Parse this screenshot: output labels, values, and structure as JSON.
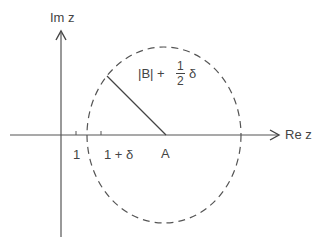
{
  "diagram": {
    "type": "complex-plane-disk",
    "colors": {
      "ink": "#444444",
      "background": "#ffffff"
    },
    "axes": {
      "x_label": "Re z",
      "y_label": "Im z"
    },
    "ticks": [
      {
        "label": "1"
      },
      {
        "label": "1 + δ"
      }
    ],
    "center": {
      "label": "A"
    },
    "radius_label": {
      "prefix": "|B| +",
      "frac_num": "1",
      "frac_den": "2",
      "suffix": "δ"
    },
    "circle_style": "dashed"
  }
}
